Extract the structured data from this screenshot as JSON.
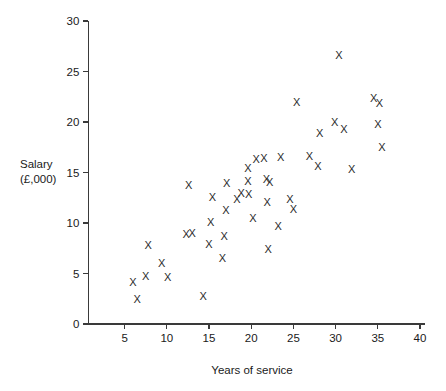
{
  "chart_data": {
    "type": "scatter",
    "title": "",
    "xlabel": "Years of service",
    "ylabel": "Salary\n(£,000)",
    "ylabel_line1": "Salary",
    "ylabel_line2": "(£,000)",
    "marker_glyph": "X",
    "marker_color": "#2b2b2b",
    "axis_color": "#3a3a3a",
    "grid": false,
    "legend": null,
    "xlim": [
      0,
      40
    ],
    "ylim": [
      0,
      30
    ],
    "xticks": [
      5,
      10,
      15,
      20,
      25,
      30,
      35,
      40
    ],
    "yticks": [
      0,
      5,
      10,
      15,
      20,
      25,
      30
    ],
    "xtick_labels": [
      "5",
      "10",
      "15",
      "20",
      "25",
      "30",
      "35",
      "40"
    ],
    "ytick_labels": [
      "0",
      "5",
      "10",
      "15",
      "20",
      "25",
      "30"
    ],
    "n_points": 45,
    "points": [
      {
        "x": 6.0,
        "y": 4.2
      },
      {
        "x": 6.5,
        "y": 2.5
      },
      {
        "x": 7.5,
        "y": 4.8
      },
      {
        "x": 7.8,
        "y": 7.8
      },
      {
        "x": 9.4,
        "y": 6.0
      },
      {
        "x": 10.1,
        "y": 4.7
      },
      {
        "x": 12.3,
        "y": 8.9
      },
      {
        "x": 12.6,
        "y": 13.8
      },
      {
        "x": 14.3,
        "y": 2.8
      },
      {
        "x": 15.0,
        "y": 7.9
      },
      {
        "x": 15.2,
        "y": 10.1
      },
      {
        "x": 16.6,
        "y": 6.5
      },
      {
        "x": 16.8,
        "y": 8.7
      },
      {
        "x": 17.0,
        "y": 11.3
      },
      {
        "x": 17.1,
        "y": 14.0
      },
      {
        "x": 18.3,
        "y": 12.4
      },
      {
        "x": 19.6,
        "y": 15.4
      },
      {
        "x": 19.6,
        "y": 14.2
      },
      {
        "x": 19.7,
        "y": 12.9
      },
      {
        "x": 20.2,
        "y": 10.5
      },
      {
        "x": 21.5,
        "y": 16.4
      },
      {
        "x": 21.8,
        "y": 14.4
      },
      {
        "x": 22.2,
        "y": 14.1
      },
      {
        "x": 21.9,
        "y": 12.1
      },
      {
        "x": 22.0,
        "y": 7.4
      },
      {
        "x": 23.2,
        "y": 9.7
      },
      {
        "x": 23.5,
        "y": 16.5
      },
      {
        "x": 25.0,
        "y": 11.4
      },
      {
        "x": 25.4,
        "y": 22.0
      },
      {
        "x": 27.9,
        "y": 15.6
      },
      {
        "x": 28.1,
        "y": 18.9
      },
      {
        "x": 30.4,
        "y": 26.6
      },
      {
        "x": 31.0,
        "y": 19.3
      },
      {
        "x": 31.9,
        "y": 15.3
      },
      {
        "x": 34.5,
        "y": 22.4
      },
      {
        "x": 35.2,
        "y": 21.9
      },
      {
        "x": 35.0,
        "y": 19.8
      },
      {
        "x": 35.5,
        "y": 17.5
      },
      {
        "x": 15.4,
        "y": 12.6
      },
      {
        "x": 20.6,
        "y": 16.3
      },
      {
        "x": 18.8,
        "y": 13.0
      },
      {
        "x": 24.6,
        "y": 12.4
      },
      {
        "x": 13.0,
        "y": 9.0
      },
      {
        "x": 26.9,
        "y": 16.6
      },
      {
        "x": 29.9,
        "y": 20.0
      }
    ]
  }
}
